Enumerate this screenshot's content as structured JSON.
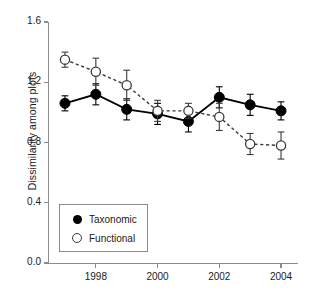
{
  "chart_data": {
    "type": "line",
    "title": "",
    "xlabel": "",
    "ylabel": "Dissimilarity among plots",
    "xlim": [
      1996.45,
      2004.55
    ],
    "ylim": [
      0.0,
      1.6
    ],
    "grid": false,
    "legend_position": "lower-left-inside",
    "x": [
      1997,
      1998,
      1999,
      2000,
      2001,
      2002,
      2003,
      2004
    ],
    "xticks": [
      1998,
      2000,
      2002,
      2004
    ],
    "xticklabels": [
      "1998",
      "2000",
      "2002",
      "2004"
    ],
    "yticks": [
      0.0,
      0.4,
      0.8,
      1.2,
      1.6
    ],
    "yticklabels": [
      "0.0",
      "0.4",
      "0.8",
      "1.2",
      "1.6"
    ],
    "series": [
      {
        "name": "Taxonomic",
        "marker": "filled-circle",
        "linestyle": "solid",
        "color": "#000000",
        "values": [
          1.06,
          1.12,
          1.02,
          0.99,
          0.94,
          1.1,
          1.05,
          1.01
        ],
        "errors": [
          0.05,
          0.07,
          0.07,
          0.07,
          0.07,
          0.07,
          0.07,
          0.06
        ]
      },
      {
        "name": "Functional",
        "marker": "open-circle",
        "linestyle": "dashed",
        "color": "#3a3a3a",
        "values": [
          1.35,
          1.27,
          1.18,
          1.01,
          1.01,
          0.97,
          0.79,
          0.78
        ],
        "errors": [
          0.05,
          0.09,
          0.1,
          0.07,
          0.05,
          0.09,
          0.07,
          0.09
        ]
      }
    ]
  },
  "legend": {
    "entries": [
      {
        "label": "Taxonomic",
        "marker": "filled-circle"
      },
      {
        "label": "Functional",
        "marker": "open-circle"
      }
    ]
  },
  "axes": {
    "ylabel": "Dissimilarity among plots"
  },
  "colors": {
    "axis": "#8c8c8c",
    "taxonomic": "#000000",
    "functional": "#3a3a3a",
    "text": "#1a1a1a",
    "background": "#ffffff"
  }
}
